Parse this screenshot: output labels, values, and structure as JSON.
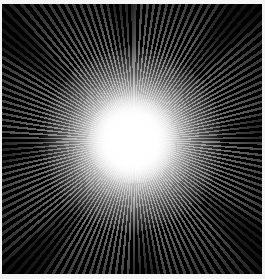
{
  "image": {
    "description": "Radial starburst of white light rays on black background",
    "colors": {
      "background": "#000000",
      "rays": "#ffffff",
      "border": "#f4f4f4"
    }
  }
}
